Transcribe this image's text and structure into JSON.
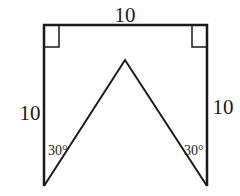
{
  "figure": {
    "labels": {
      "top_side": "10",
      "left_side": "10",
      "right_side": "10",
      "left_angle": "30°",
      "right_angle": "30°"
    },
    "colors": {
      "stroke": "#1a1a1a",
      "background": "#ffffff"
    },
    "markers": [
      "right-angle-top-left",
      "right-angle-top-right"
    ]
  }
}
